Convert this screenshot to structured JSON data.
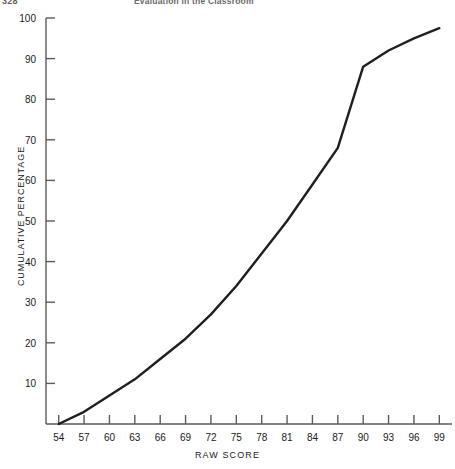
{
  "page": {
    "folio": "328",
    "running_title": "Evaluation in the Classroom"
  },
  "chart_data": {
    "type": "line",
    "title": "",
    "subtitle": "",
    "xlabel": "RAW SCORE",
    "ylabel": "CUMULATIVE PERCENTAGE",
    "xlim": [
      52.5,
      100.5
    ],
    "ylim": [
      0,
      100
    ],
    "xticks": [
      54,
      57,
      60,
      63,
      66,
      69,
      72,
      75,
      78,
      81,
      84,
      87,
      90,
      93,
      96,
      99
    ],
    "xtick_labels": [
      "54",
      "57",
      "60",
      "63",
      "66",
      "69",
      "72",
      "75",
      "78",
      "81",
      "84",
      "87",
      "90",
      "93",
      "96",
      "99"
    ],
    "yticks": [
      10,
      20,
      30,
      40,
      50,
      60,
      70,
      80,
      90,
      100
    ],
    "ytick_labels": [
      "10",
      "20",
      "30",
      "40",
      "50",
      "60",
      "70",
      "80",
      "90",
      "100"
    ],
    "grid": false,
    "legend": false,
    "legend_position": "none",
    "line_color": "#211f1e",
    "line_width": 2.4,
    "axis_color": "#5a5a5a",
    "series": [
      {
        "name": "Cumulative percentage",
        "x": [
          54,
          57,
          60,
          63,
          66,
          69,
          72,
          75,
          78,
          81,
          84,
          87,
          90,
          93,
          96,
          99
        ],
        "values": [
          0,
          3,
          7,
          11,
          16,
          21,
          27,
          34,
          42,
          50,
          59,
          68,
          88,
          92,
          95,
          97.5
        ]
      }
    ],
    "annotations": []
  }
}
